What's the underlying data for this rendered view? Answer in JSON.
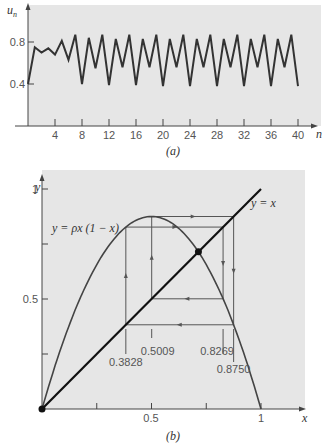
{
  "chart_data": [
    {
      "type": "line",
      "panel": "(a)",
      "title": "",
      "xlabel": "n",
      "ylabel": "u_n",
      "xlim": [
        0,
        40
      ],
      "ylim": [
        0,
        1
      ],
      "xticks": [
        4,
        8,
        12,
        16,
        20,
        24,
        28,
        32,
        36,
        40
      ],
      "yticks": [
        0.4,
        0.8
      ],
      "grid": false,
      "series": [
        {
          "name": "u_n (rho = 3.5)",
          "x": [
            0,
            1,
            2,
            3,
            4,
            5,
            6,
            7,
            8,
            9,
            10,
            11,
            12,
            13,
            14,
            15,
            16,
            17,
            18,
            19,
            20,
            21,
            22,
            23,
            24,
            25,
            26,
            27,
            28,
            29,
            30,
            31,
            32,
            33,
            34,
            35,
            36,
            37,
            38,
            39,
            40
          ],
          "values": [
            0.4,
            0.75,
            0.7,
            0.74,
            0.68,
            0.81,
            0.63,
            0.87,
            0.4,
            0.84,
            0.55,
            0.87,
            0.39,
            0.83,
            0.56,
            0.87,
            0.39,
            0.83,
            0.56,
            0.87,
            0.38,
            0.83,
            0.56,
            0.87,
            0.38,
            0.83,
            0.56,
            0.87,
            0.38,
            0.83,
            0.56,
            0.87,
            0.38,
            0.83,
            0.56,
            0.87,
            0.38,
            0.83,
            0.56,
            0.87,
            0.38
          ]
        }
      ]
    },
    {
      "type": "line",
      "panel": "(b)",
      "title": "",
      "xlabel": "x",
      "ylabel": "y",
      "xlim": [
        0,
        1
      ],
      "ylim": [
        0,
        1
      ],
      "xticks": [
        0.25,
        0.5,
        0.75,
        1
      ],
      "xtick_labels": [
        "",
        "0.5",
        "",
        "1"
      ],
      "yticks": [
        0.25,
        0.5,
        0.75,
        1
      ],
      "ytick_labels": [
        "",
        "0.5",
        "",
        "1"
      ],
      "grid": false,
      "series": [
        {
          "name": "y = ρx(1 − x)",
          "function": "3.5*x*(1-x)"
        },
        {
          "name": "y = x",
          "x": [
            0,
            1
          ],
          "values": [
            0,
            1
          ]
        }
      ],
      "cycle_points": [
        0.3828,
        0.5009,
        0.8269,
        0.875
      ],
      "fixed_points": [
        [
          0,
          0
        ],
        [
          0.7143,
          0.7143
        ]
      ],
      "annotations": [
        "y = ρx (1 − x)",
        "y = x",
        "0.3828",
        "0.5009",
        "0.8269",
        "0.8750"
      ]
    }
  ],
  "panel_a": {
    "caption": "(a)",
    "ylabel": "u",
    "ylabel_sub": "n",
    "xlabel": "n",
    "yticks": [
      "0.8",
      "0.4"
    ],
    "xticks": [
      "4",
      "8",
      "12",
      "16",
      "20",
      "24",
      "28",
      "32",
      "36",
      "40"
    ]
  },
  "panel_b": {
    "caption": "(b)",
    "ylabel": "y",
    "xlabel": "x",
    "yticks": [
      "1",
      "0.5"
    ],
    "xticks": [
      "0.5",
      "1"
    ],
    "curve_label": "y = ρx (1 − x)",
    "line_label": "y = x",
    "labels": {
      "a": "0.3828",
      "b": "0.5009",
      "c": "0.8269",
      "d": "0.8750"
    }
  },
  "colors": {
    "panel_bg": "#e6e6e6",
    "line": "#333333",
    "axis": "#444444"
  }
}
